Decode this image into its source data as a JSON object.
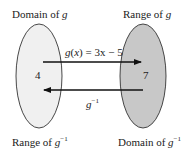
{
  "diagram": {
    "labels": {
      "top_left": {
        "text": "Domain of ",
        "var": "g",
        "sup": ""
      },
      "top_right": {
        "text": "Range of ",
        "var": "g",
        "sup": ""
      },
      "bottom_left": {
        "text": "Range of ",
        "var": "g",
        "sup": "−1"
      },
      "bottom_right": {
        "text": "Domain of ",
        "var": "g",
        "sup": "−1"
      }
    },
    "left_set": {
      "value": "4",
      "fill": "#f0f0f0"
    },
    "right_set": {
      "value": "7",
      "fill": "#c8c8c8"
    },
    "forward_arrow": {
      "func": "g",
      "arg": "x",
      "rhs": " = 3x − 5",
      "direction": "right"
    },
    "inverse_arrow": {
      "var": "g",
      "sup": "−1",
      "direction": "left"
    },
    "colors": {
      "stroke": "#333333",
      "text": "#222222"
    }
  }
}
